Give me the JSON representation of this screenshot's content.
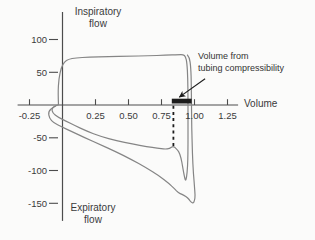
{
  "colors": {
    "curve": "#858585",
    "axis": "#4c4c4c",
    "text": "#3a3a3a",
    "marker": "#1c1c1c",
    "background": "#fbfbfa"
  },
  "chart_data": {
    "type": "line",
    "xlabel": "Volume",
    "flow_axis_label_top": [
      "Inspiratory",
      "flow"
    ],
    "flow_axis_label_bottom": [
      "Expiratory",
      "flow"
    ],
    "x_ticks": [
      -0.25,
      0.25,
      0.5,
      0.75,
      1.0,
      1.25
    ],
    "x_tick_labels": [
      "-0.25",
      "0.25",
      "0.50",
      "0.75",
      "1.00",
      "1.25"
    ],
    "y_ticks": [
      100,
      50,
      -50,
      -100,
      -150
    ],
    "y_tick_labels": [
      "100",
      "50",
      "-50",
      "-100",
      "-150"
    ],
    "xlim": [
      -0.34,
      1.33
    ],
    "ylim": [
      -177,
      142
    ],
    "grid": false,
    "annotation": {
      "lines": [
        "Volume from",
        "tubing compressibility"
      ],
      "arrow_from": [
        1.08,
        40
      ],
      "arrow_to": [
        0.885,
        12
      ]
    },
    "compressibility_bar": {
      "x_start": 0.828,
      "x_end": 0.978
    },
    "dashed_line": {
      "x": 0.84,
      "flow_from": -1,
      "flow_to": -64
    },
    "series": [
      {
        "name": "breath-loop-inner",
        "points": [
          [
            -0.03,
            0
          ],
          [
            -0.034,
            18
          ],
          [
            -0.028,
            40
          ],
          [
            -0.008,
            58
          ],
          [
            0.015,
            66
          ],
          [
            0.045,
            70
          ],
          [
            0.1,
            72
          ],
          [
            0.2,
            73
          ],
          [
            0.35,
            74
          ],
          [
            0.5,
            74.5
          ],
          [
            0.65,
            75
          ],
          [
            0.78,
            76
          ],
          [
            0.88,
            77
          ],
          [
            0.915,
            77
          ],
          [
            0.932,
            74
          ],
          [
            0.943,
            64
          ],
          [
            0.949,
            40
          ],
          [
            0.951,
            10
          ],
          [
            0.951,
            -30
          ],
          [
            0.951,
            -70
          ],
          [
            0.948,
            -95
          ],
          [
            0.94,
            -110
          ],
          [
            0.932,
            -116.5
          ],
          [
            0.922,
            -108
          ],
          [
            0.91,
            -94
          ],
          [
            0.897,
            -80
          ],
          [
            0.88,
            -70.5
          ],
          [
            0.86,
            -66.5
          ],
          [
            0.838,
            -62.5
          ],
          [
            0.812,
            -66.5
          ],
          [
            0.775,
            -67.5
          ],
          [
            0.72,
            -66
          ],
          [
            0.64,
            -63.5
          ],
          [
            0.53,
            -59.5
          ],
          [
            0.41,
            -54.5
          ],
          [
            0.29,
            -48
          ],
          [
            0.18,
            -39.5
          ],
          [
            0.09,
            -31
          ],
          [
            0.02,
            -24
          ],
          [
            -0.035,
            -18.5
          ],
          [
            -0.075,
            -12
          ],
          [
            -0.082,
            -5
          ],
          [
            -0.05,
            -1
          ]
        ]
      },
      {
        "name": "breath-loop-outer",
        "points": [
          [
            0.945,
            77
          ],
          [
            0.962,
            73
          ],
          [
            0.972,
            58
          ],
          [
            0.976,
            30
          ],
          [
            0.977,
            0
          ],
          [
            0.979,
            -35
          ],
          [
            0.984,
            -75
          ],
          [
            0.992,
            -105
          ],
          [
            1.0,
            -125
          ],
          [
            1.005,
            -138
          ],
          [
            1.001,
            -146
          ],
          [
            0.99,
            -150
          ],
          [
            0.976,
            -148.5
          ],
          [
            0.958,
            -144
          ],
          [
            0.935,
            -139.5
          ],
          [
            0.905,
            -136.5
          ],
          [
            0.878,
            -134
          ],
          [
            0.85,
            -128
          ],
          [
            0.805,
            -119.5
          ],
          [
            0.73,
            -108
          ],
          [
            0.635,
            -96
          ],
          [
            0.52,
            -83
          ],
          [
            0.4,
            -71
          ],
          [
            0.28,
            -60
          ],
          [
            0.17,
            -50
          ],
          [
            0.07,
            -40.5
          ],
          [
            -0.01,
            -33
          ],
          [
            -0.065,
            -27.5
          ],
          [
            -0.1,
            -20
          ],
          [
            -0.108,
            -10
          ],
          [
            -0.07,
            -3
          ],
          [
            -0.03,
            0.5
          ]
        ]
      }
    ]
  }
}
